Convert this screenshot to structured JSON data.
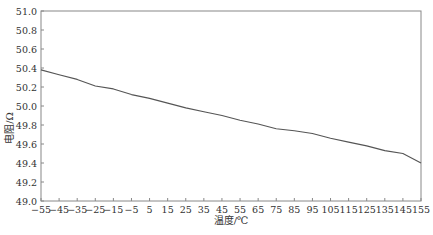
{
  "chart_data": {
    "type": "line",
    "title": "",
    "xlabel": "温度/℃",
    "ylabel": "电阻/Ω",
    "xlim": [
      -55,
      155
    ],
    "ylim": [
      49.0,
      51.0
    ],
    "grid": false,
    "legend": null,
    "x_ticks": [
      -55,
      -45,
      -35,
      -25,
      -15,
      -5,
      5,
      15,
      25,
      35,
      45,
      55,
      65,
      75,
      85,
      95,
      105,
      115,
      125,
      135,
      145,
      155
    ],
    "x_tick_labels": [
      "−55",
      "−45",
      "−35",
      "−25",
      "−15",
      "−5",
      "5",
      "15",
      "25",
      "35",
      "45",
      "55",
      "65",
      "75",
      "85",
      "95",
      "105",
      "115",
      "125",
      "135",
      "145",
      "155"
    ],
    "y_ticks": [
      49.0,
      49.2,
      49.4,
      49.6,
      49.8,
      50.0,
      50.2,
      50.4,
      50.6,
      50.8,
      51.0
    ],
    "y_tick_labels": [
      "49.0",
      "49.2",
      "49.4",
      "49.6",
      "49.8",
      "50.0",
      "50.2",
      "50.4",
      "50.6",
      "50.8",
      "51.0"
    ],
    "series": [
      {
        "name": "电阻",
        "color": "#555555",
        "x": [
          -55,
          -45,
          -35,
          -25,
          -15,
          -5,
          5,
          15,
          25,
          35,
          45,
          55,
          65,
          75,
          85,
          95,
          105,
          115,
          125,
          135,
          145,
          155
        ],
        "values": [
          50.38,
          50.33,
          50.28,
          50.21,
          50.18,
          50.12,
          50.08,
          50.03,
          49.98,
          49.94,
          49.9,
          49.85,
          49.81,
          49.76,
          49.74,
          49.71,
          49.66,
          49.62,
          49.58,
          49.53,
          49.5,
          49.4
        ]
      }
    ]
  }
}
